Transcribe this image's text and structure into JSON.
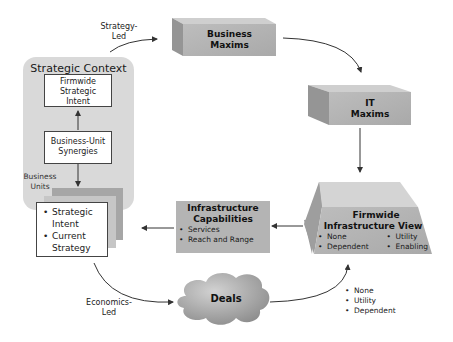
{
  "diagram": {
    "strategic_context": {
      "title": "Strategic Context",
      "firmwide_intent": [
        "Firmwide",
        "Strategic",
        "Intent"
      ],
      "bu_synergies": [
        "Business-Unit",
        "Synergies"
      ],
      "business_units_label": [
        "Business",
        "Units"
      ],
      "bu_items": [
        "Strategic Intent",
        "Current Strategy"
      ],
      "bu_item_lines": [
        [
          "Strategic",
          "Intent"
        ],
        [
          "Current",
          "Strategy"
        ]
      ]
    },
    "strategy_led_label": [
      "Strategy-",
      "Led"
    ],
    "economics_led_label": [
      "Economics-",
      "Led"
    ],
    "business_maxims": [
      "Business",
      "Maxims"
    ],
    "it_maxims": [
      "IT",
      "Maxims"
    ],
    "firmwide_view": {
      "title": [
        "Firmwide",
        "Infrastructure View"
      ],
      "items_left": [
        "None",
        "Dependent"
      ],
      "items_right": [
        "Utility",
        "Enabling"
      ]
    },
    "infra_capabilities": {
      "title": [
        "Infrastructure",
        "Capabilities"
      ],
      "items": [
        "Services",
        "Reach and Range"
      ]
    },
    "deals": {
      "label": "Deals",
      "items": [
        "None",
        "Utility",
        "Dependent"
      ]
    },
    "colors": {
      "panel_bg": "#d9d9d9",
      "box_front": "#b3b3b3",
      "box_top": "#cfcfcf",
      "box_side": "#9a9a9a",
      "stack1": "#a8a8a8",
      "stack2": "#c4c4c4",
      "arrow": "#333333"
    }
  }
}
